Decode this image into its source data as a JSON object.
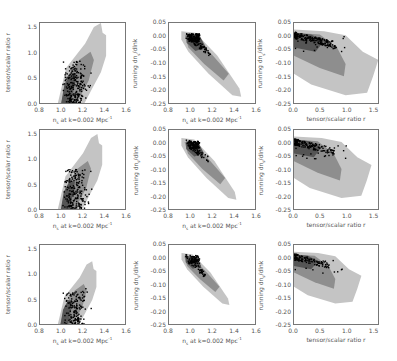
{
  "chart_data": [
    {
      "type": "scatter",
      "panel": "row1-col1",
      "title": "",
      "xlabel": "n_s at k=0.002 Mpc^-1",
      "ylabel": "tensor/scalar ratio r",
      "xlim": [
        0.8,
        1.6
      ],
      "ylim": [
        0.0,
        1.6
      ],
      "xticks": [
        "0.8",
        "1.0",
        "1.2",
        "1.4",
        "1.6"
      ],
      "yticks": [
        "0.0",
        "0.5",
        "1.0",
        "1.5"
      ],
      "contours": "68%/95% confidence regions (dark/light grey) with model points",
      "grid": false
    },
    {
      "type": "scatter",
      "panel": "row1-col2",
      "xlabel": "n_s at k=0.002 Mpc^-1",
      "ylabel": "running dn_s/dlnk",
      "xlim": [
        0.8,
        1.6
      ],
      "ylim": [
        -0.25,
        0.05
      ],
      "xticks": [
        "0.8",
        "1.0",
        "1.2",
        "1.4",
        "1.6"
      ],
      "yticks": [
        "0.05",
        "0.00",
        "-0.05",
        "-0.10",
        "-0.15",
        "-0.20",
        "-0.25"
      ],
      "grid": false
    },
    {
      "type": "scatter",
      "panel": "row1-col3",
      "xlabel": "tensor/scalar ratio r",
      "ylabel": "running dn_s/dlnk",
      "xlim": [
        0.0,
        1.6
      ],
      "ylim": [
        -0.25,
        0.05
      ],
      "xticks": [
        "0.0",
        "0.5",
        "1.0",
        "1.5"
      ],
      "yticks": [
        "0.05",
        "0.00",
        "-0.05",
        "-0.10",
        "-0.15",
        "-0.20",
        "-0.25"
      ],
      "grid": false
    },
    {
      "type": "scatter",
      "panel": "row2-col1",
      "xlabel": "n_s at k=0.002 Mpc^-1",
      "ylabel": "tensor/scalar ratio r",
      "xlim": [
        0.8,
        1.6
      ],
      "ylim": [
        0.0,
        1.6
      ],
      "xticks": [
        "0.8",
        "1.0",
        "1.2",
        "1.4",
        "1.6"
      ],
      "yticks": [
        "0.0",
        "0.5",
        "1.0",
        "1.5"
      ]
    },
    {
      "type": "scatter",
      "panel": "row2-col2",
      "xlabel": "n_s at k=0.002 Mpc^-1",
      "ylabel": "running dn_s/dlnk",
      "xlim": [
        0.8,
        1.6
      ],
      "ylim": [
        -0.25,
        0.05
      ],
      "xticks": [
        "0.8",
        "1.0",
        "1.2",
        "1.4",
        "1.6"
      ],
      "yticks": [
        "0.05",
        "0.00",
        "-0.05",
        "-0.10",
        "-0.15",
        "-0.20",
        "-0.25"
      ]
    },
    {
      "type": "scatter",
      "panel": "row2-col3",
      "xlabel": "tensor/scalar ratio r",
      "ylabel": "running dn_s/dlnk",
      "xlim": [
        0.0,
        1.6
      ],
      "ylim": [
        -0.25,
        0.05
      ],
      "xticks": [
        "0.0",
        "0.5",
        "1.0",
        "1.5"
      ],
      "yticks": [
        "0.05",
        "0.00",
        "-0.05",
        "-0.10",
        "-0.15",
        "-0.20",
        "-0.25"
      ]
    },
    {
      "type": "scatter",
      "panel": "row3-col1",
      "xlabel": "n_s at k=0.002 Mpc^-1",
      "ylabel": "tensor/scalar ratio r",
      "xlim": [
        0.8,
        1.6
      ],
      "ylim": [
        0.0,
        1.6
      ],
      "xticks": [
        "0.8",
        "1.0",
        "1.2",
        "1.4",
        "1.6"
      ],
      "yticks": [
        "0.0",
        "0.5",
        "1.0",
        "1.5"
      ]
    },
    {
      "type": "scatter",
      "panel": "row3-col2",
      "xlabel": "n_s at k=0.002 Mpc^-1",
      "ylabel": "running dn_s/dlnk",
      "xlim": [
        0.8,
        1.6
      ],
      "ylim": [
        -0.25,
        0.05
      ],
      "xticks": [
        "0.8",
        "1.0",
        "1.2",
        "1.4",
        "1.6"
      ],
      "yticks": [
        "0.05",
        "0.00",
        "-0.05",
        "-0.10",
        "-0.15",
        "-0.20",
        "-0.25"
      ]
    },
    {
      "type": "scatter",
      "panel": "row3-col3",
      "xlabel": "tensor/scalar ratio r",
      "ylabel": "running dn_s/dlnk",
      "xlim": [
        0.0,
        1.6
      ],
      "ylim": [
        -0.25,
        0.05
      ],
      "xticks": [
        "0.0",
        "0.5",
        "1.0",
        "1.5"
      ],
      "yticks": [
        "0.05",
        "0.00",
        "-0.05",
        "-0.10",
        "-0.15",
        "-0.20",
        "-0.25"
      ]
    }
  ],
  "labels": {
    "ns": "n",
    "ns_sub": "s",
    "ns_rest": " at k=0.002 Mpc",
    "ns_sup": "-1",
    "r": "tensor/scalar ratio r",
    "run_pre": "running dn",
    "run_sub": "s",
    "run_post": "/dlnk"
  },
  "ticks": {
    "ns": [
      "0.8",
      "1.0",
      "1.2",
      "1.4",
      "1.6"
    ],
    "r_y": [
      "1.5",
      "1.0",
      "0.5",
      "0.0"
    ],
    "run_y": [
      "0.05",
      "0.00",
      "-0.05",
      "-0.10",
      "-0.15",
      "-0.20",
      "-0.25"
    ],
    "r_x": [
      "0.0",
      "0.5",
      "1.0",
      "1.5"
    ]
  },
  "colors": {
    "light": "#c4c4c4",
    "mid": "#8e8e8e",
    "dark": "#555555",
    "points": "#000000",
    "frame": "#777777"
  }
}
